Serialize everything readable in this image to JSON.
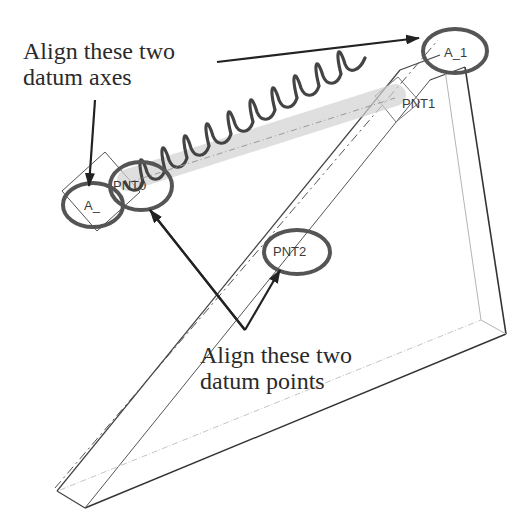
{
  "callouts": {
    "axes": {
      "line1": "Align these two",
      "line2": "datum axes"
    },
    "points": {
      "line1": "Align these two",
      "line2": "datum points"
    }
  },
  "labels": {
    "axis_a0": "A_",
    "axis_a1": "A_1",
    "point_pnt0": "PNT0",
    "point_pnt1": "PNT1",
    "point_pnt2": "PNT2"
  },
  "colors": {
    "ink": "#2a2a2a",
    "highlight_ellipse": "#555555",
    "spring": "#444444",
    "spring_glow": "#c8c8c8",
    "edge_dark": "#3c3c3c",
    "edge_light": "#b4b4b4"
  }
}
